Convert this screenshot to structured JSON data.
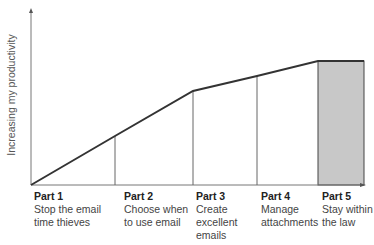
{
  "diagram": {
    "y_axis_label": "Increasing my productivity",
    "fill_color": "#c8c8c8",
    "line_color": "#333333",
    "parts": [
      {
        "title": "Part 1",
        "lines": [
          "Stop the email",
          "time thieves"
        ]
      },
      {
        "title": "Part 2",
        "lines": [
          "Choose when",
          "to use email"
        ]
      },
      {
        "title": "Part 3",
        "lines": [
          "Create",
          "excellent",
          "emails"
        ]
      },
      {
        "title": "Part 4",
        "lines": [
          "Manage",
          "attachments"
        ]
      },
      {
        "title": "Part 5",
        "lines": [
          "Stay within",
          "the law"
        ]
      }
    ]
  }
}
